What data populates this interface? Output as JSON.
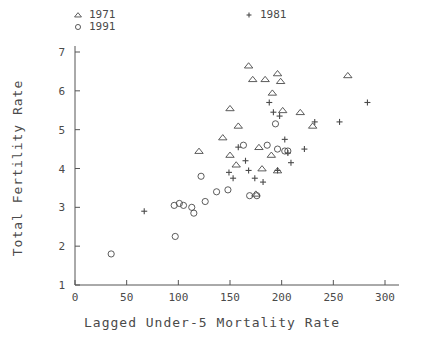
{
  "chart_data": {
    "type": "scatter",
    "title": "",
    "xlabel": "Lagged Under-5 Mortality Rate",
    "ylabel": "Total Fertility Rate",
    "xlim": [
      0,
      300
    ],
    "ylim": [
      1,
      7
    ],
    "xticks": [
      0,
      50,
      100,
      150,
      200,
      250,
      300
    ],
    "yticks": [
      1,
      2,
      3,
      4,
      5,
      6,
      7
    ],
    "grid": false,
    "legend_position": "top-left",
    "series": [
      {
        "name": "1971",
        "marker": "triangle",
        "points": [
          [
            120,
            4.45
          ],
          [
            150,
            5.55
          ],
          [
            158,
            5.1
          ],
          [
            168,
            6.65
          ],
          [
            172,
            6.3
          ],
          [
            184,
            6.3
          ],
          [
            191,
            5.95
          ],
          [
            196,
            6.45
          ],
          [
            199,
            6.25
          ],
          [
            201,
            5.5
          ],
          [
            178,
            4.55
          ],
          [
            181,
            4.0
          ],
          [
            190,
            4.35
          ],
          [
            196,
            3.95
          ],
          [
            143,
            4.8
          ],
          [
            150,
            4.35
          ],
          [
            156,
            4.1
          ],
          [
            175,
            3.35
          ],
          [
            218,
            5.45
          ],
          [
            264,
            6.4
          ],
          [
            230,
            5.1
          ]
        ]
      },
      {
        "name": "1981",
        "marker": "plus",
        "points": [
          [
            158,
            4.55
          ],
          [
            165,
            4.2
          ],
          [
            168,
            3.95
          ],
          [
            174,
            3.75
          ],
          [
            182,
            3.65
          ],
          [
            188,
            5.7
          ],
          [
            192,
            5.45
          ],
          [
            198,
            5.35
          ],
          [
            203,
            4.75
          ],
          [
            206,
            4.4
          ],
          [
            209,
            4.15
          ],
          [
            196,
            3.95
          ],
          [
            149,
            3.9
          ],
          [
            153,
            3.75
          ],
          [
            232,
            5.2
          ],
          [
            256,
            5.2
          ],
          [
            283,
            5.7
          ],
          [
            222,
            4.5
          ]
        ]
      },
      {
        "name": "1991",
        "marker": "circle",
        "points": [
          [
            35,
            1.8
          ],
          [
            97,
            2.25
          ],
          [
            96,
            3.05
          ],
          [
            101,
            3.1
          ],
          [
            105,
            3.05
          ],
          [
            113,
            3.0
          ],
          [
            115,
            2.85
          ],
          [
            126,
            3.15
          ],
          [
            122,
            3.8
          ],
          [
            137,
            3.4
          ],
          [
            148,
            3.45
          ],
          [
            163,
            4.6
          ],
          [
            169,
            3.3
          ],
          [
            176,
            3.3
          ],
          [
            186,
            4.6
          ],
          [
            194,
            5.15
          ],
          [
            196,
            4.5
          ],
          [
            203,
            4.45
          ],
          [
            206,
            4.45
          ]
        ]
      }
    ],
    "unmarked_points": [
      {
        "x": 67,
        "y": 2.9,
        "marker": "plus"
      }
    ]
  },
  "legend": {
    "entries": [
      {
        "label": "1971",
        "marker": "triangle"
      },
      {
        "label": "1991",
        "marker": "circle"
      },
      {
        "label": "1981",
        "marker": "plus"
      }
    ]
  },
  "colors": {
    "ink": "#4a4a4a",
    "axis": "#555555",
    "background": "#ffffff"
  }
}
